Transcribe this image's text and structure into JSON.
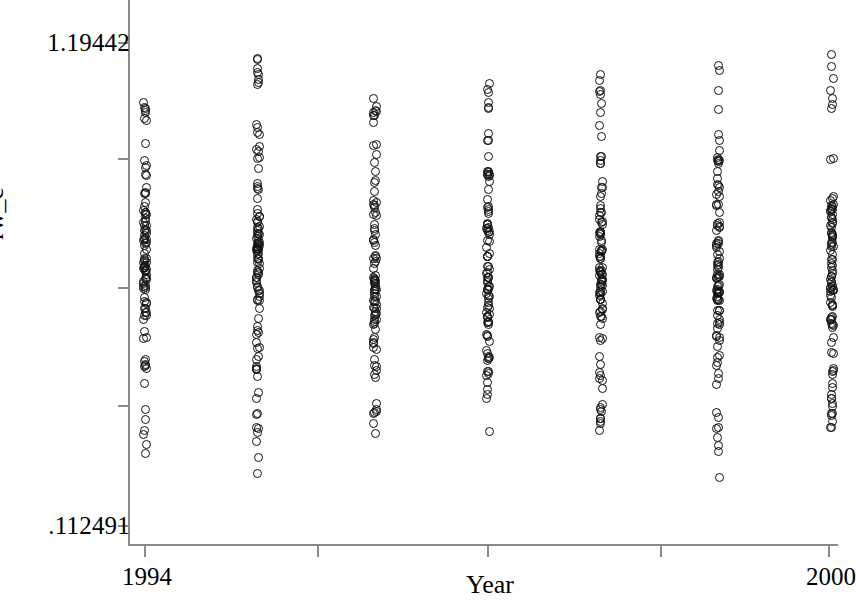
{
  "chart_data": {
    "type": "scatter",
    "title": "",
    "subtitle": "",
    "xlabel": "Year",
    "ylabel": "rw_c",
    "grid": false,
    "legend": false,
    "legend_position": "none",
    "marker_style": "open-circle",
    "marker_color": "#111111",
    "axis_color": "#8a8a8a",
    "xlim": [
      1993.6,
      2000.4
    ],
    "ylim": [
      0.112491,
      1.19442
    ],
    "y_ticks": [
      0.112491,
      1.19442
    ],
    "y_tick_labels": [
      ".112491",
      "1.19442"
    ],
    "y_unlabeled_tick_count": 3,
    "x_ticks": [
      1994,
      2000
    ],
    "x_tick_labels": [
      "1994",
      "2000"
    ],
    "x_unlabeled_tick_count": 3,
    "categories": [
      1994,
      1995,
      1996,
      1997,
      1998,
      1999,
      2000
    ],
    "series": [
      {
        "name": "rw_c",
        "x": [
          1994,
          1995,
          1996,
          1997,
          1998,
          1999,
          2000
        ],
        "column_summaries": [
          {
            "year": 1994,
            "min": 0.268,
            "max": 1.082,
            "dense_low": 0.48,
            "dense_high": 0.92,
            "n_points": 96
          },
          {
            "year": 1995,
            "min": 0.113,
            "max": 1.194,
            "dense_low": 0.46,
            "dense_high": 0.94,
            "n_points": 104
          },
          {
            "year": 1996,
            "min": 0.305,
            "max": 1.069,
            "dense_low": 0.46,
            "dense_high": 0.88,
            "n_points": 92
          },
          {
            "year": 1997,
            "min": 0.292,
            "max": 1.119,
            "dense_low": 0.46,
            "dense_high": 0.9,
            "n_points": 95
          },
          {
            "year": 1998,
            "min": 0.3,
            "max": 1.14,
            "dense_low": 0.46,
            "dense_high": 0.93,
            "n_points": 100
          },
          {
            "year": 1999,
            "min": 0.2,
            "max": 1.15,
            "dense_low": 0.47,
            "dense_high": 0.93,
            "n_points": 98
          },
          {
            "year": 2000,
            "min": 0.325,
            "max": 1.19,
            "dense_low": 0.46,
            "dense_high": 0.92,
            "n_points": 97
          }
        ]
      }
    ]
  },
  "axes": {
    "y_labels": [
      {
        "value": 1.19442,
        "text": "1.19442"
      },
      {
        "value": 0.112491,
        "text": ".112491"
      }
    ],
    "x_labels": [
      {
        "value": 1994,
        "text": "1994"
      },
      {
        "value": 2000,
        "text": "2000"
      }
    ],
    "y_title": "rw_c",
    "x_title": "Year"
  }
}
